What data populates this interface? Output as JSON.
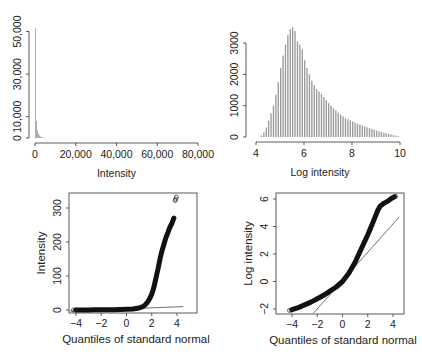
{
  "chart_data": [
    {
      "type": "bar",
      "panel": "top-left",
      "title": "",
      "xlabel": "Intensity",
      "ylabel": "",
      "xlim": [
        0,
        80000
      ],
      "ylim": [
        0,
        52000
      ],
      "x_ticks": [
        0,
        20000,
        40000,
        60000,
        80000
      ],
      "x_tick_labels": [
        "0",
        "20,000",
        "40,000",
        "60,000",
        "80,000"
      ],
      "y_ticks": [
        0,
        10000,
        30000,
        50000
      ],
      "y_tick_labels": [
        "0",
        "10,000",
        "30,000",
        "50,000"
      ],
      "grid": false,
      "bin_width": 500,
      "bin_starts": [
        0,
        500,
        1000,
        1500,
        2000,
        2500,
        3000,
        3500,
        4000,
        4500
      ],
      "values": [
        51500,
        8000,
        3500,
        2000,
        1200,
        700,
        400,
        250,
        150,
        80
      ],
      "bar_color": "#9a9a9a"
    },
    {
      "type": "bar",
      "panel": "top-right",
      "title": "",
      "xlabel": "Log intensity",
      "ylabel": "",
      "xlim": [
        4,
        10
      ],
      "ylim": [
        0,
        3500
      ],
      "x_ticks": [
        4,
        6,
        8,
        10
      ],
      "x_tick_labels": [
        "4",
        "6",
        "8",
        "10"
      ],
      "y_ticks": [
        0,
        1000,
        2000,
        3000
      ],
      "y_tick_labels": [
        "0",
        "1000",
        "2000",
        "3000"
      ],
      "grid": false,
      "bin_width": 0.1,
      "bin_starts": [
        4.2,
        4.3,
        4.4,
        4.5,
        4.6,
        4.7,
        4.8,
        4.9,
        5.0,
        5.1,
        5.2,
        5.3,
        5.4,
        5.5,
        5.6,
        5.7,
        5.8,
        5.9,
        6.0,
        6.1,
        6.2,
        6.3,
        6.4,
        6.5,
        6.6,
        6.7,
        6.8,
        6.9,
        7.0,
        7.1,
        7.2,
        7.3,
        7.4,
        7.5,
        7.6,
        7.7,
        7.8,
        7.9,
        8.0,
        8.1,
        8.2,
        8.3,
        8.4,
        8.5,
        8.6,
        8.7,
        8.8,
        8.9,
        9.0,
        9.1,
        9.2,
        9.3,
        9.4,
        9.5,
        9.6,
        9.7,
        9.8,
        9.9
      ],
      "values": [
        50,
        150,
        300,
        520,
        760,
        1000,
        1350,
        1750,
        2200,
        2600,
        2950,
        3250,
        3450,
        3500,
        3380,
        3050,
        2950,
        2800,
        2450,
        2200,
        2000,
        1800,
        1650,
        1530,
        1450,
        1380,
        1280,
        1180,
        1080,
        1000,
        920,
        850,
        780,
        720,
        660,
        600,
        570,
        530,
        490,
        460,
        430,
        400,
        370,
        340,
        310,
        280,
        260,
        230,
        200,
        180,
        160,
        140,
        120,
        100,
        80,
        60,
        40,
        25
      ],
      "bar_color": "#9a9a9a"
    },
    {
      "type": "scatter",
      "panel": "bottom-left",
      "title": "",
      "xlabel": "Quantiles of standard normal",
      "ylabel": "Intensity",
      "xlim": [
        -4.5,
        4.5
      ],
      "ylim": [
        -5,
        340
      ],
      "x_ticks": [
        -4,
        -2,
        0,
        2,
        4
      ],
      "x_tick_labels": [
        "−4",
        "−2",
        "0",
        "2",
        "4"
      ],
      "y_ticks": [
        0,
        100,
        200,
        300
      ],
      "y_tick_labels": [
        "0",
        "100",
        "200",
        "300"
      ],
      "grid": false,
      "qq_points": {
        "x": [
          -4.2,
          -4.0,
          -3.5,
          -3.0,
          -2.5,
          -2.0,
          -1.5,
          -1.0,
          -0.5,
          0.0,
          0.5,
          1.0,
          1.3,
          1.5,
          1.7,
          1.9,
          2.0,
          2.1,
          2.2,
          2.3,
          2.4,
          2.5,
          2.6,
          2.7,
          2.8,
          2.9,
          3.0,
          3.1,
          3.2,
          3.3,
          3.4,
          3.5,
          3.6,
          3.7,
          3.75,
          3.85,
          3.95
        ],
        "y": [
          0.1,
          0.2,
          0.3,
          0.4,
          0.5,
          0.6,
          0.8,
          1.0,
          1.5,
          2,
          3,
          6,
          10,
          16,
          25,
          38,
          47,
          58,
          72,
          88,
          105,
          122,
          140,
          158,
          172,
          185,
          198,
          210,
          220,
          230,
          240,
          248,
          255,
          265,
          270,
          322,
          332
        ]
      },
      "reference_line": {
        "x": [
          -4.5,
          4.5
        ],
        "y": [
          -3,
          10
        ]
      },
      "marker": "open-circle"
    },
    {
      "type": "scatter",
      "panel": "bottom-right",
      "title": "",
      "xlabel": "Quantiles of standard normal",
      "ylabel": "Log intensity",
      "xlim": [
        -4.5,
        4.5
      ],
      "ylim": [
        -2.3,
        6.4
      ],
      "x_ticks": [
        -4,
        -2,
        0,
        2,
        4
      ],
      "x_tick_labels": [
        "−4",
        "−2",
        "0",
        "2",
        "4"
      ],
      "y_ticks": [
        -2,
        0,
        2,
        4,
        6
      ],
      "y_tick_labels": [
        "−2",
        "0",
        "2",
        "4",
        "6"
      ],
      "grid": false,
      "qq_points": {
        "x": [
          -4.2,
          -4.0,
          -3.5,
          -3.0,
          -2.5,
          -2.0,
          -1.5,
          -1.0,
          -0.5,
          0.0,
          0.5,
          1.0,
          1.5,
          2.0,
          2.5,
          2.8,
          3.0,
          3.3,
          3.6,
          3.9,
          4.1,
          4.2
        ],
        "y": [
          -2.1,
          -2.05,
          -1.9,
          -1.7,
          -1.5,
          -1.25,
          -1.0,
          -0.7,
          -0.4,
          0.0,
          0.6,
          1.4,
          2.4,
          3.4,
          4.5,
          5.2,
          5.5,
          5.7,
          5.85,
          6.05,
          6.15,
          6.2
        ]
      },
      "reference_line": {
        "x": [
          -2.3,
          4.5
        ],
        "y": [
          -2.3,
          4.7
        ]
      },
      "marker": "open-circle"
    }
  ]
}
